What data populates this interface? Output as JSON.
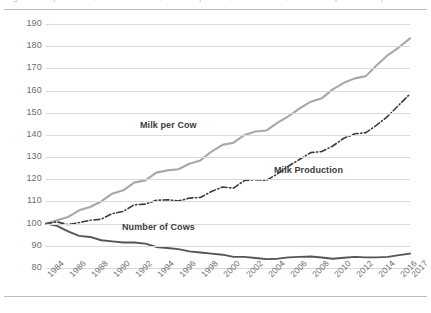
{
  "figure": {
    "top_rule": "",
    "bottom_rule": "",
    "cropped_caption": "Figure. Milk production, number of cows, and milk per cow, United States, 1984-2017 (1984 = 100)"
  },
  "chart_data": {
    "type": "line",
    "title": "",
    "xlabel": "",
    "ylabel": "",
    "ylim": [
      80,
      190
    ],
    "ytick_step": 10,
    "yticks": [
      190,
      180,
      170,
      160,
      150,
      140,
      130,
      120,
      110,
      100,
      90,
      80
    ],
    "grid": true,
    "legend_position": "inline-annotations",
    "x": [
      1984,
      1985,
      1986,
      1987,
      1988,
      1989,
      1990,
      1991,
      1992,
      1993,
      1994,
      1995,
      1996,
      1997,
      1998,
      1999,
      2000,
      2001,
      2002,
      2003,
      2004,
      2005,
      2006,
      2007,
      2008,
      2009,
      2010,
      2011,
      2012,
      2013,
      2014,
      2015,
      2016,
      2017
    ],
    "xticks": [
      "1984",
      "1986",
      "1988",
      "1990",
      "1992",
      "1994",
      "1996",
      "1998",
      "2000",
      "2002",
      "2004",
      "2006",
      "2008",
      "2010",
      "2012",
      "2014",
      "2016",
      "2017"
    ],
    "series": [
      {
        "name": "Milk per Cow",
        "color": "#a8a8a8",
        "style": "solid",
        "width": 2.1,
        "label_x": 140,
        "label_y": 120,
        "values": [
          100.0,
          101.5,
          103.0,
          106.0,
          107.5,
          110.0,
          113.5,
          115.0,
          118.5,
          119.5,
          123.0,
          124.0,
          124.5,
          127.0,
          128.5,
          132.5,
          135.5,
          136.5,
          140.0,
          141.5,
          142.0,
          145.5,
          148.5,
          152.0,
          155.0,
          156.5,
          160.5,
          163.5,
          165.5,
          166.5,
          171.5,
          176.0,
          179.5,
          183.5
        ]
      },
      {
        "name": "Milk Production",
        "color": "#3b3b3b",
        "style": "dash-dot",
        "width": 1.6,
        "label_x": 274,
        "label_y": 165,
        "values": [
          100.0,
          100.8,
          99.5,
          100.5,
          101.5,
          102.0,
          104.5,
          105.5,
          108.5,
          108.8,
          110.5,
          110.8,
          110.2,
          111.5,
          111.8,
          114.5,
          116.5,
          116.0,
          119.5,
          119.8,
          119.5,
          122.5,
          126.0,
          129.0,
          132.0,
          132.5,
          135.0,
          138.5,
          140.5,
          141.0,
          144.5,
          148.5,
          153.5,
          158.5
        ]
      },
      {
        "name": "Number of Cows",
        "color": "#555555",
        "style": "solid",
        "width": 1.9,
        "label_x": 122,
        "label_y": 222,
        "values": [
          100.0,
          99.0,
          96.5,
          94.5,
          94.0,
          92.5,
          92.0,
          91.5,
          91.5,
          91.0,
          89.5,
          89.0,
          88.5,
          87.5,
          87.0,
          86.5,
          86.0,
          85.0,
          85.0,
          84.5,
          84.0,
          84.2,
          84.8,
          85.0,
          85.2,
          84.7,
          84.2,
          84.6,
          85.0,
          84.8,
          84.8,
          85.0,
          85.8,
          86.5
        ]
      }
    ]
  }
}
